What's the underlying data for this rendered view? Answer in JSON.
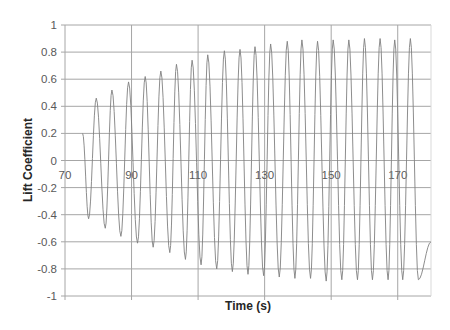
{
  "chart_data": {
    "type": "line",
    "title": "",
    "xlabel": "Time (s)",
    "ylabel": "Lift Coefficient",
    "xlim": [
      70,
      180
    ],
    "ylim": [
      -1,
      1
    ],
    "x_ticks": [
      70,
      90,
      110,
      130,
      150,
      170
    ],
    "y_ticks": [
      1,
      0.8,
      0.6,
      0.4,
      0.2,
      0,
      -0.2,
      -0.4,
      -0.6,
      -0.8,
      -1
    ],
    "y_tick_labels": [
      "1",
      "0.8",
      "0.6",
      "0.4",
      "0.2",
      "0",
      "-0.2",
      "-0.4",
      "-0.6",
      "-0.8",
      "-1"
    ],
    "x_tick_labels": [
      "70",
      "90",
      "110",
      "130",
      "150",
      "170"
    ],
    "x_tick_label_position": "at y=0 crossing",
    "grid": true,
    "legend": null,
    "line_color": "#808080",
    "grid_color": "#a6a6a6",
    "series": [
      {
        "name": "Lift Coefficient",
        "x": [
          75.3,
          77.1,
          79.4,
          82.1,
          84.1,
          86.8,
          89.1,
          91.8,
          94.1,
          96.5,
          98.8,
          101.5,
          103.5,
          106.2,
          108.2,
          110.9,
          112.9,
          115.6,
          117.9,
          120.3,
          122.6,
          125.0,
          127.1,
          129.7,
          131.8,
          134.4,
          136.8,
          139.1,
          141.2,
          143.8,
          145.9,
          148.5,
          150.6,
          153.2,
          155.3,
          157.9,
          160.0,
          162.4,
          164.7,
          167.1,
          169.1,
          171.5,
          173.8,
          176.2,
          180.0
        ],
        "y": [
          0.2,
          -0.43,
          0.46,
          -0.5,
          0.52,
          -0.56,
          0.58,
          -0.61,
          0.62,
          -0.64,
          0.66,
          -0.68,
          0.71,
          -0.73,
          0.74,
          -0.77,
          0.78,
          -0.8,
          0.81,
          -0.82,
          0.82,
          -0.84,
          0.84,
          -0.85,
          0.86,
          -0.86,
          0.88,
          -0.87,
          0.89,
          -0.87,
          0.88,
          -0.89,
          0.89,
          -0.88,
          0.89,
          -0.88,
          0.9,
          -0.88,
          0.9,
          -0.88,
          0.89,
          -0.88,
          0.9,
          -0.88,
          -0.6
        ]
      }
    ]
  }
}
